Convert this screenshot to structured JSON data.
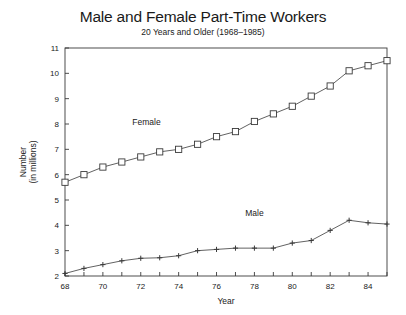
{
  "chart_data": {
    "type": "line",
    "title": "Male and Female Part-Time Workers",
    "subtitle": "20 Years and Older (1968–1985)",
    "xlabel": "Year",
    "ylabel_line1": "Number",
    "ylabel_line2": "(in millions)",
    "xlim": [
      1968,
      1985
    ],
    "ylim": [
      2,
      11
    ],
    "xticks": [
      1968,
      1969,
      1970,
      1971,
      1972,
      1973,
      1974,
      1975,
      1976,
      1977,
      1978,
      1979,
      1980,
      1981,
      1982,
      1983,
      1984,
      1985
    ],
    "xtick_labels": [
      "68",
      "",
      "70",
      "",
      "72",
      "",
      "74",
      "",
      "76",
      "",
      "78",
      "",
      "80",
      "",
      "82",
      "",
      "84",
      ""
    ],
    "yticks": [
      2,
      3,
      4,
      5,
      6,
      7,
      8,
      9,
      10,
      11
    ],
    "ytick_labels": [
      "2",
      "3",
      "4",
      "5",
      "6",
      "7",
      "8",
      "9",
      "10",
      "11"
    ],
    "grid": false,
    "legend_position": "inline-annotations",
    "x": [
      1968,
      1969,
      1970,
      1971,
      1972,
      1973,
      1974,
      1975,
      1976,
      1977,
      1978,
      1979,
      1980,
      1981,
      1982,
      1983,
      1984,
      1985
    ],
    "series": [
      {
        "name": "Female",
        "marker": "open-square",
        "label_x": 1972.3,
        "label_y": 7.95,
        "values": [
          5.7,
          6.0,
          6.3,
          6.5,
          6.7,
          6.9,
          7.0,
          7.2,
          7.5,
          7.7,
          8.1,
          8.4,
          8.7,
          9.1,
          9.5,
          10.1,
          10.3,
          10.5
        ]
      },
      {
        "name": "Male",
        "marker": "plus",
        "label_x": 1978.0,
        "label_y": 4.35,
        "values": [
          2.1,
          2.3,
          2.45,
          2.6,
          2.7,
          2.72,
          2.8,
          3.0,
          3.05,
          3.1,
          3.1,
          3.1,
          3.3,
          3.4,
          3.8,
          4.2,
          4.1,
          4.05
        ]
      }
    ]
  }
}
